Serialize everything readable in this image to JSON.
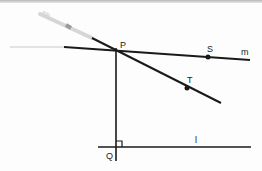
{
  "diagram": {
    "type": "geometry-construction",
    "colors": {
      "line": "#1a1a1a",
      "pencil": "#c8c8c8",
      "faint_line": "#bdbdbd",
      "background": "#fdfdfd"
    },
    "points": [
      {
        "id": "P",
        "label": "P",
        "x": 116,
        "y": 50
      },
      {
        "id": "S",
        "label": "S",
        "x": 208,
        "y": 57
      },
      {
        "id": "T",
        "label": "T",
        "x": 187,
        "y": 88
      },
      {
        "id": "Q",
        "label": "Q",
        "x": 116,
        "y": 147
      }
    ],
    "lines": [
      {
        "id": "m",
        "label": "m",
        "from": [
          64,
          47
        ],
        "to": [
          250,
          60
        ]
      },
      {
        "id": "PT",
        "label": "",
        "from": [
          92,
          38
        ],
        "to": [
          221,
          103
        ]
      },
      {
        "id": "PQ",
        "label": "",
        "from": [
          116,
          50
        ],
        "to": [
          116,
          161
        ]
      },
      {
        "id": "l",
        "label": "l",
        "from": [
          98,
          147
        ],
        "to": [
          251,
          147
        ]
      }
    ],
    "right_angle_marker": {
      "at": "Q",
      "size": 6
    },
    "labels": {
      "P": "P",
      "S": "S",
      "T": "T",
      "Q": "Q",
      "m": "m",
      "l": "l"
    }
  }
}
